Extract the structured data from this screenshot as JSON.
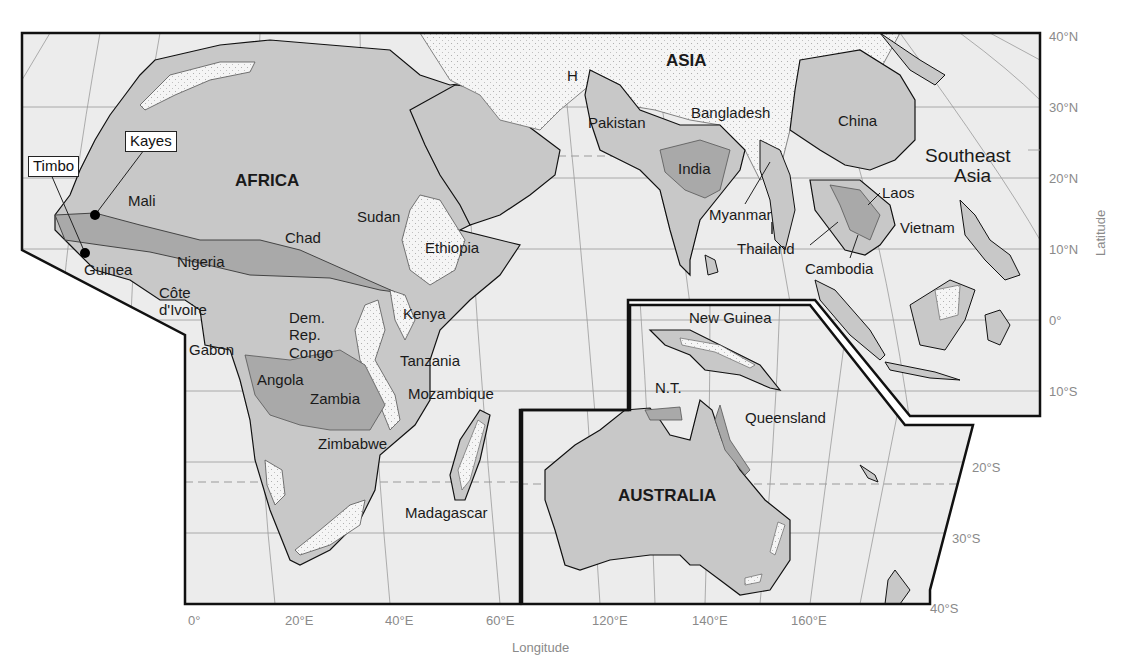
{
  "map": {
    "colors": {
      "ocean": "#ececec",
      "land": "#c8c8c8",
      "highland_dark": "#a9a9a9",
      "stippled_high": "#f4f4f4",
      "frame": "#111111",
      "grid": "#9a9a9a",
      "axis_text": "#8a8a8a"
    },
    "regions": [
      {
        "id": "africa",
        "text": "AFRICA",
        "x": 235,
        "y": 172,
        "style": "bold"
      },
      {
        "id": "asia",
        "text": "ASIA",
        "x": 666,
        "y": 57,
        "style": "bold"
      },
      {
        "id": "australia",
        "text": "AUSTRALIA",
        "x": 618,
        "y": 487,
        "style": "bold"
      },
      {
        "id": "southeast-asia",
        "text": "Southeast",
        "x": 925,
        "y": 146,
        "style": "region"
      },
      {
        "id": "southeast-asia-2",
        "text": "Asia",
        "x": 954,
        "y": 166,
        "style": "region"
      }
    ],
    "places": [
      {
        "id": "h",
        "text": "H",
        "x": 567,
        "y": 68
      },
      {
        "id": "pakistan",
        "text": "Pakistan",
        "x": 588,
        "y": 114
      },
      {
        "id": "bangladesh",
        "text": "Bangladesh",
        "x": 691,
        "y": 104
      },
      {
        "id": "china",
        "text": "China",
        "x": 838,
        "y": 113
      },
      {
        "id": "india",
        "text": "India",
        "x": 678,
        "y": 161
      },
      {
        "id": "laos",
        "text": "Laos",
        "x": 882,
        "y": 185
      },
      {
        "id": "myanmar",
        "text": "Myanmar",
        "x": 709,
        "y": 207
      },
      {
        "id": "vietnam",
        "text": "Vietnam",
        "x": 900,
        "y": 220
      },
      {
        "id": "thailand",
        "text": "Thailand",
        "x": 737,
        "y": 241
      },
      {
        "id": "cambodia",
        "text": "Cambodia",
        "x": 805,
        "y": 261
      },
      {
        "id": "mali",
        "text": "Mali",
        "x": 128,
        "y": 193
      },
      {
        "id": "sudan",
        "text": "Sudan",
        "x": 357,
        "y": 209
      },
      {
        "id": "chad",
        "text": "Chad",
        "x": 285,
        "y": 230
      },
      {
        "id": "ethiopia",
        "text": "Ethiopia",
        "x": 425,
        "y": 240
      },
      {
        "id": "guinea",
        "text": "Guinea",
        "x": 84,
        "y": 262
      },
      {
        "id": "nigeria",
        "text": "Nigeria",
        "x": 177,
        "y": 254
      },
      {
        "id": "cote-divoire-1",
        "text": "Côte",
        "x": 159,
        "y": 285
      },
      {
        "id": "cote-divoire-2",
        "text": "d'Ivoire",
        "x": 159,
        "y": 302
      },
      {
        "id": "kenya",
        "text": "Kenya",
        "x": 403,
        "y": 306
      },
      {
        "id": "dem-rep-congo-1",
        "text": "Dem.",
        "x": 289,
        "y": 310
      },
      {
        "id": "dem-rep-congo-2",
        "text": "Rep.",
        "x": 289,
        "y": 327
      },
      {
        "id": "dem-rep-congo-3",
        "text": "Congo",
        "x": 289,
        "y": 345
      },
      {
        "id": "gabon",
        "text": "Gabon",
        "x": 189,
        "y": 342
      },
      {
        "id": "tanzania",
        "text": "Tanzania",
        "x": 400,
        "y": 353
      },
      {
        "id": "angola",
        "text": "Angola",
        "x": 257,
        "y": 372
      },
      {
        "id": "zambia",
        "text": "Zambia",
        "x": 310,
        "y": 391
      },
      {
        "id": "mozambique",
        "text": "Mozambique",
        "x": 408,
        "y": 386
      },
      {
        "id": "zimbabwe",
        "text": "Zimbabwe",
        "x": 318,
        "y": 436
      },
      {
        "id": "madagascar",
        "text": "Madagascar",
        "x": 405,
        "y": 505
      },
      {
        "id": "new-guinea",
        "text": "New Guinea",
        "x": 689,
        "y": 310
      },
      {
        "id": "nt",
        "text": "N.T.",
        "x": 655,
        "y": 380
      },
      {
        "id": "queensland",
        "text": "Queensland",
        "x": 745,
        "y": 410
      }
    ],
    "callouts": [
      {
        "id": "kayes",
        "text": "Kayes",
        "x": 125,
        "y": 131,
        "dot_x": 95,
        "dot_y": 215
      },
      {
        "id": "timbo",
        "text": "Timbo",
        "x": 28,
        "y": 156,
        "dot_x": 85,
        "dot_y": 253
      }
    ],
    "latitude_ticks": [
      {
        "text": "40°N",
        "x": 1049,
        "y": 30
      },
      {
        "text": "30°N",
        "x": 1049,
        "y": 102
      },
      {
        "text": "20°N",
        "x": 1049,
        "y": 173
      },
      {
        "text": "10°N",
        "x": 1049,
        "y": 244
      },
      {
        "text": "0°",
        "x": 1049,
        "y": 315
      },
      {
        "text": "10°S",
        "x": 1049,
        "y": 386
      },
      {
        "text": "20°S",
        "x": 972,
        "y": 462
      },
      {
        "text": "30°S",
        "x": 952,
        "y": 533
      },
      {
        "text": "40°S",
        "x": 930,
        "y": 603
      }
    ],
    "longitude_ticks": [
      {
        "text": "0°",
        "x": 188,
        "y": 614
      },
      {
        "text": "20°E",
        "x": 285,
        "y": 614
      },
      {
        "text": "40°E",
        "x": 385,
        "y": 614
      },
      {
        "text": "60°E",
        "x": 486,
        "y": 614
      },
      {
        "text": "120°E",
        "x": 592,
        "y": 614
      },
      {
        "text": "140°E",
        "x": 692,
        "y": 614
      },
      {
        "text": "160°E",
        "x": 791,
        "y": 614
      }
    ],
    "axis_labels": {
      "latitude": "Latitude",
      "longitude": "Longitude"
    }
  }
}
